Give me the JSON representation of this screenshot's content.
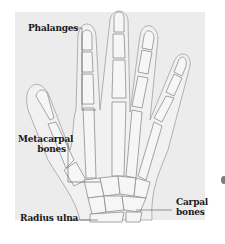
{
  "diagram": {
    "background_color": "#ececec",
    "bone_color": "#f4f4f4",
    "outline_color": "#8a8a8a",
    "labels": {
      "phalanges": "Phalanges",
      "metacarpal_line1": "Metacarpal",
      "metacarpal_line2": "bones",
      "radius_ulna": "Radius ulna",
      "carpal_line1": "Carpal",
      "carpal_line2": "bones"
    }
  }
}
